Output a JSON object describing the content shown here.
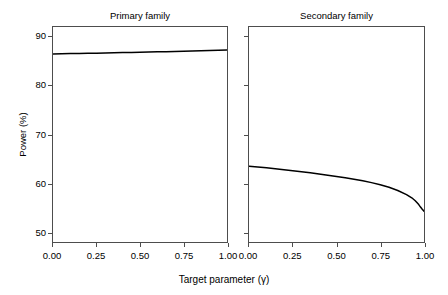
{
  "figure": {
    "background_color": "#ffffff",
    "line_color": "#000000",
    "axis_color": "#4d4d4d"
  },
  "axes": {
    "ylabel": "Power (%)",
    "xlabel": "Target parameter (γ)",
    "yticks": [
      "50",
      "60",
      "70",
      "80",
      "90"
    ],
    "xticks": [
      "0.00",
      "0.25",
      "0.50",
      "0.75",
      "1.00"
    ]
  },
  "panels": {
    "left_title": "Primary family",
    "right_title": "Secondary family"
  },
  "chart_data": {
    "type": "line",
    "title": "",
    "xlabel": "Target parameter (γ)",
    "ylabel": "Power (%)",
    "xlim": [
      0.0,
      1.0
    ],
    "ylim": [
      48.0,
      92.0
    ],
    "xticks": [
      0.0,
      0.25,
      0.5,
      0.75,
      1.0
    ],
    "yticks": [
      50,
      60,
      70,
      80,
      90
    ],
    "grid": false,
    "legend": "none",
    "panels": [
      {
        "panel_title": "Primary family",
        "series": [
          {
            "name": "Primary family power",
            "x": [
              0.0,
              0.05,
              0.1,
              0.15,
              0.2,
              0.25,
              0.3,
              0.35,
              0.4,
              0.45,
              0.5,
              0.55,
              0.6,
              0.65,
              0.7,
              0.75,
              0.8,
              0.85,
              0.9,
              0.95,
              1.0
            ],
            "y": [
              86.5,
              86.53,
              86.56,
              86.59,
              86.62,
              86.65,
              86.69,
              86.72,
              86.76,
              86.8,
              86.84,
              86.88,
              86.92,
              86.96,
              87.0,
              87.05,
              87.1,
              87.15,
              87.2,
              87.25,
              87.3
            ]
          }
        ]
      },
      {
        "panel_title": "Secondary family",
        "series": [
          {
            "name": "Secondary family power",
            "x": [
              0.0,
              0.05,
              0.1,
              0.15,
              0.2,
              0.25,
              0.3,
              0.35,
              0.4,
              0.45,
              0.5,
              0.55,
              0.6,
              0.65,
              0.7,
              0.75,
              0.8,
              0.85,
              0.9,
              0.93,
              0.95,
              0.97,
              0.98,
              0.99,
              1.0
            ],
            "y": [
              63.5,
              63.35,
              63.18,
              63.0,
              62.8,
              62.6,
              62.38,
              62.15,
              61.92,
              61.68,
              61.42,
              61.15,
              60.85,
              60.52,
              60.15,
              59.72,
              59.2,
              58.55,
              57.7,
              57.05,
              56.45,
              55.65,
              55.15,
              54.7,
              54.3
            ]
          }
        ]
      }
    ]
  }
}
